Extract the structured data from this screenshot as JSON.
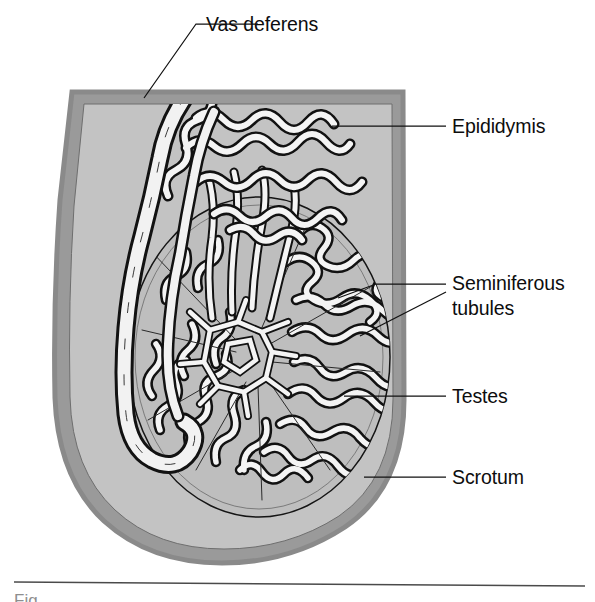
{
  "figure": {
    "type": "anatomical-diagram",
    "canvas": {
      "width": 595,
      "height": 602
    },
    "labels": [
      {
        "id": "vas-deferens",
        "text": "Vas deferens",
        "x": 206,
        "y": 31,
        "anchor": "start"
      },
      {
        "id": "epididymis",
        "text": "Epididymis",
        "x": 452,
        "y": 133,
        "anchor": "start"
      },
      {
        "id": "seminiferous-line1",
        "text": "Seminiferous",
        "x": 452,
        "y": 290,
        "anchor": "start"
      },
      {
        "id": "seminiferous-line2",
        "text": "tubules",
        "x": 452,
        "y": 315,
        "anchor": "start"
      },
      {
        "id": "testes",
        "text": "Testes",
        "x": 452,
        "y": 403,
        "anchor": "start"
      },
      {
        "id": "scrotum",
        "text": "Scrotum",
        "x": 452,
        "y": 484,
        "anchor": "start"
      }
    ],
    "structures": [
      {
        "id": "scrotum",
        "name": "Scrotum",
        "description": "outer sac wall, dark gray rim"
      },
      {
        "id": "scrotal-cavity",
        "name": "Scrotal cavity",
        "description": "light gray interior"
      },
      {
        "id": "testis",
        "name": "Testes",
        "description": "large oval organ"
      },
      {
        "id": "epididymis",
        "name": "Epididymis",
        "description": "coiled duct over superior testis"
      },
      {
        "id": "vas-deferens",
        "name": "Vas deferens",
        "description": "thick duct ascending at left"
      },
      {
        "id": "seminiferous-tubules",
        "name": "Seminiferous tubules",
        "description": "convoluted tubules in lobules"
      },
      {
        "id": "rete-testis",
        "name": "Rete testis",
        "description": "central anastomosing network"
      },
      {
        "id": "efferent-ductules",
        "name": "Efferent ductules",
        "description": "ducts linking rete to epididymis"
      }
    ],
    "colors": {
      "background": "#ffffff",
      "scrotum_outer": "#9a9a9a",
      "scrotum_inner": "#b8b8b8",
      "cavity": "#c3c3c3",
      "testis_fill": "#bdbdbd",
      "tubule_fill": "#f2f2f2",
      "outline": "#111111",
      "label_text": "#0d0d0d",
      "rule": "#4a4a4a"
    },
    "rule": {
      "x1": 14,
      "y1": 582,
      "x2": 585,
      "y2": 586
    },
    "caption_fragment": "Fig"
  }
}
